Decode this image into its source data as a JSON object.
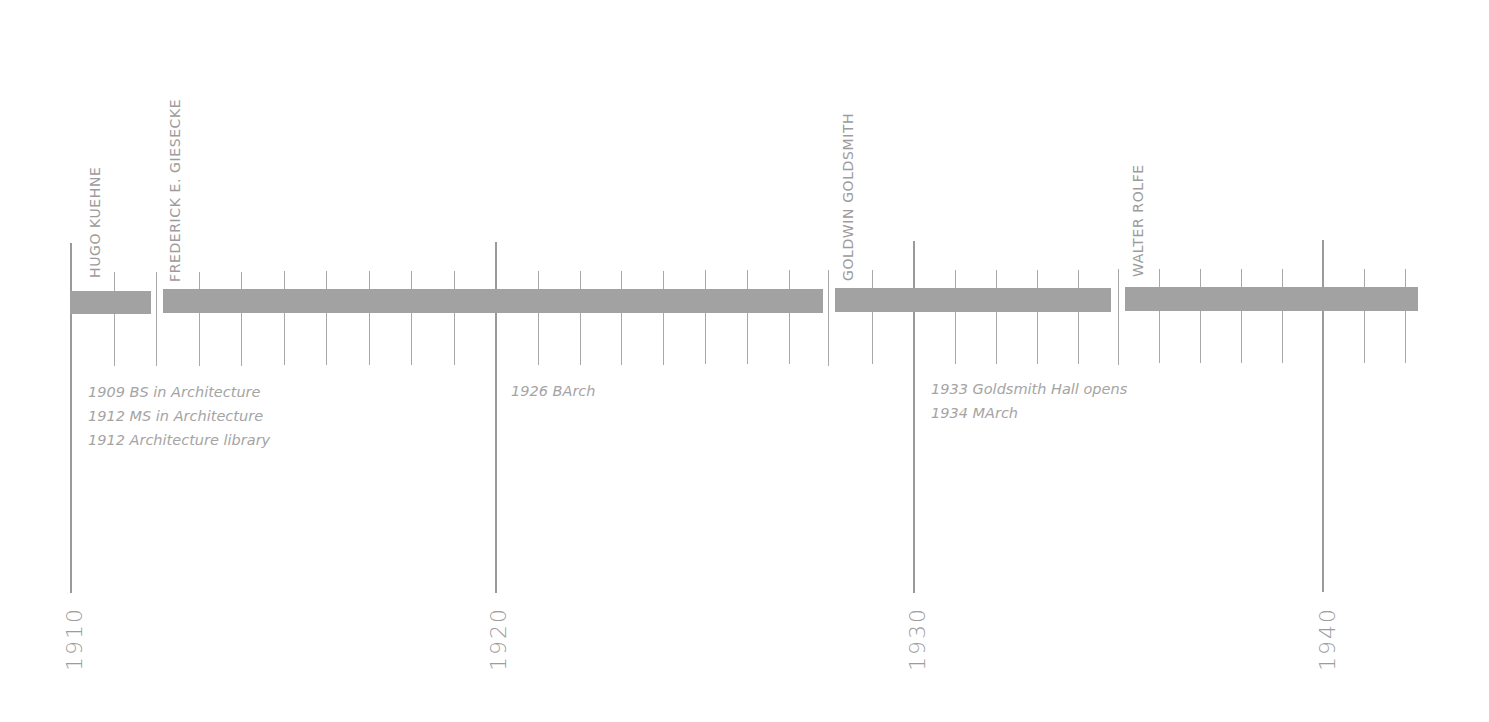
{
  "chart_data": {
    "type": "timeline",
    "title": "",
    "x_axis": {
      "start_year": 1910,
      "end_year": 1942,
      "major_ticks": [
        1910,
        1920,
        1930,
        1940
      ],
      "minor_tick_step": 1
    },
    "tenures": [
      {
        "name": "HUGO KUEHNE",
        "start": 1910,
        "end": 1912
      },
      {
        "name": "FREDERICK E. GIESECKE",
        "start": 1912,
        "end": 1928
      },
      {
        "name": "GOLDWIN GOLDSMITH",
        "start": 1928,
        "end": 1935
      },
      {
        "name": "WALTER ROLFE",
        "start": 1935,
        "end": 1942
      }
    ],
    "events": [
      {
        "year": 1909,
        "label": "1909 BS in Architecture"
      },
      {
        "year": 1912,
        "label": "1912 MS in Architecture"
      },
      {
        "year": 1912,
        "label": "1912 Architecture library"
      },
      {
        "year": 1926,
        "label": "1926 BArch"
      },
      {
        "year": 1933,
        "label": "1933 Goldsmith Hall opens"
      },
      {
        "year": 1934,
        "label": "1934 MArch"
      }
    ],
    "colors": {
      "bar": "#a2a2a2",
      "lines": "#9a9a9a",
      "text": "#9c9c9c"
    }
  },
  "names": {
    "kuehne": "HUGO KUEHNE",
    "giesecke": "FREDERICK E. GIESECKE",
    "goldsmith": "GOLDWIN GOLDSMITH",
    "rolfe": "WALTER ROLFE"
  },
  "decades": {
    "d1910": "1910",
    "d1920": "1920",
    "d1930": "1930",
    "d1940": "1940"
  },
  "event_groups": {
    "g1910s": [
      "1909 BS in Architecture",
      "1912 MS in Architecture",
      "1912 Architecture library"
    ],
    "g1920s": [
      "1926 BArch"
    ],
    "g1930s": [
      "1933 Goldsmith Hall opens",
      "1934 MArch"
    ]
  }
}
